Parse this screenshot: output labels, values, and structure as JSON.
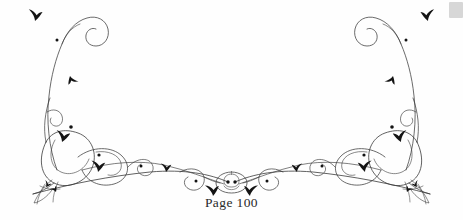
{
  "page": {
    "width": 463,
    "height": 220,
    "background_color": "#fefefe",
    "ink_color": "#1a1a1a",
    "line_color": "#3a3a3a",
    "smudge_color": "#c9c9c9"
  },
  "caption": {
    "text": "Page 100",
    "page_number": 100
  },
  "ornament": {
    "name": "symmetric-calligraphic-flourish",
    "description": "Hand-drawn pen-and-ink foliate vignette, bilaterally symmetric about the vertical center line",
    "center_motif": "oval rosette with two dots",
    "corner_terminal": "tasselled tuft",
    "stroke_width_thin": 0.7,
    "stroke_width_medium": 1.0
  }
}
